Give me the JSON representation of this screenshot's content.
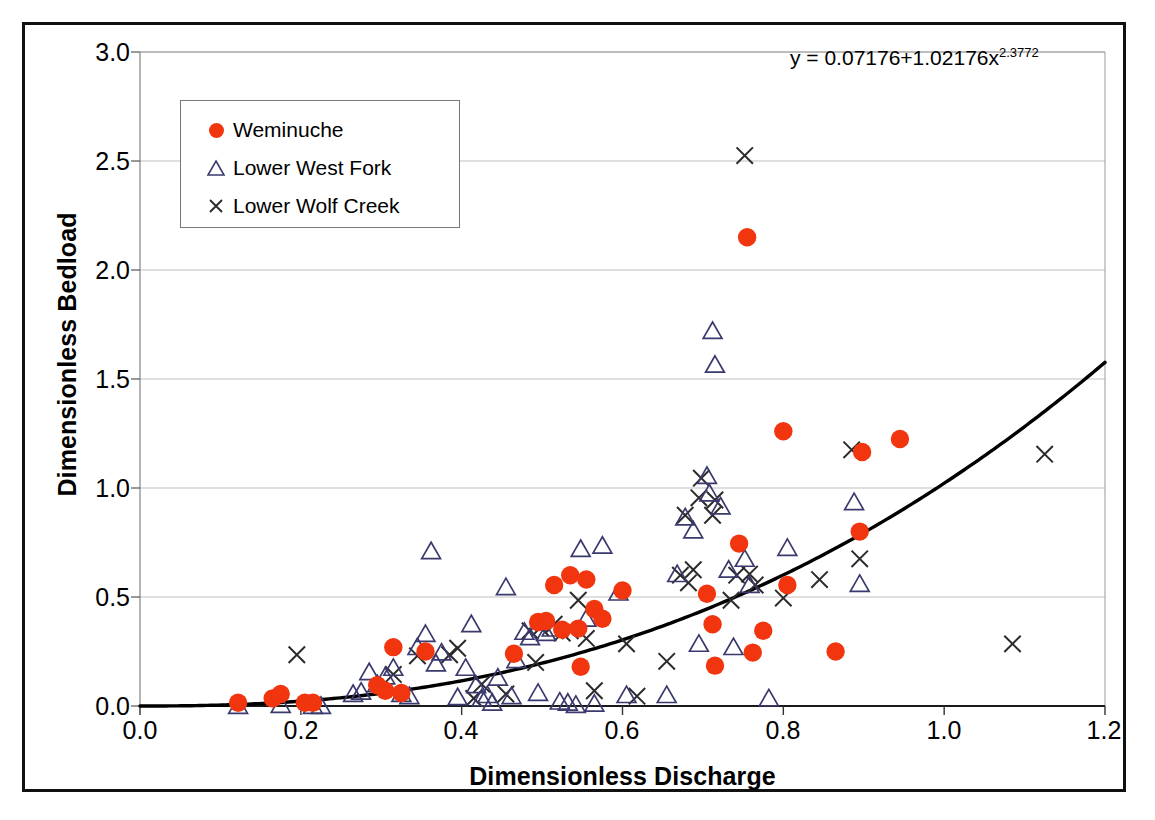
{
  "chart_data": {
    "type": "scatter",
    "title": "",
    "xlabel": "Dimensionless Discharge",
    "ylabel": "Dimensionless Bedload",
    "xlim": [
      0.0,
      1.2
    ],
    "ylim": [
      0.0,
      3.0
    ],
    "xticks": [
      "0.0",
      "0.2",
      "0.4",
      "0.6",
      "0.8",
      "1.0",
      "1.2"
    ],
    "yticks": [
      "0.0",
      "0.5",
      "1.0",
      "1.5",
      "2.0",
      "2.5",
      "3.0"
    ],
    "grid": "horizontal",
    "legend_position": "upper-left",
    "annotations": [
      {
        "text": "y = 0.07176+1.02176x",
        "exponent": "2.3772",
        "x": 0.82,
        "y": 2.82
      }
    ],
    "colors": {
      "weminuche": "#F0350F",
      "lower_west_fork": "#3A3A6E",
      "lower_wolf_creek": "#2B2B2B",
      "trendline": "#000000",
      "gridline": "#BFBFBF",
      "frame": "#111111"
    },
    "trendline": {
      "label": "power fit",
      "equation": "y = 0.07176+1.02176*x^2.3772",
      "intercept": 0.07176,
      "coefficient": 1.02176,
      "exponent": 2.3772,
      "offset": -0.0718,
      "x_range": [
        0.0,
        1.2
      ]
    },
    "series": [
      {
        "name": "Weminuche",
        "marker": "circle-filled",
        "color": "#F0350F",
        "points": [
          [
            0.122,
            0.015
          ],
          [
            0.165,
            0.035
          ],
          [
            0.175,
            0.055
          ],
          [
            0.205,
            0.015
          ],
          [
            0.215,
            0.015
          ],
          [
            0.295,
            0.095
          ],
          [
            0.305,
            0.07
          ],
          [
            0.315,
            0.27
          ],
          [
            0.325,
            0.06
          ],
          [
            0.355,
            0.25
          ],
          [
            0.465,
            0.24
          ],
          [
            0.495,
            0.385
          ],
          [
            0.505,
            0.39
          ],
          [
            0.515,
            0.555
          ],
          [
            0.525,
            0.35
          ],
          [
            0.535,
            0.6
          ],
          [
            0.545,
            0.355
          ],
          [
            0.548,
            0.18
          ],
          [
            0.555,
            0.58
          ],
          [
            0.565,
            0.445
          ],
          [
            0.575,
            0.4
          ],
          [
            0.6,
            0.53
          ],
          [
            0.705,
            0.515
          ],
          [
            0.712,
            0.375
          ],
          [
            0.715,
            0.185
          ],
          [
            0.745,
            0.745
          ],
          [
            0.755,
            2.15
          ],
          [
            0.762,
            0.245
          ],
          [
            0.775,
            0.345
          ],
          [
            0.8,
            1.26
          ],
          [
            0.805,
            0.555
          ],
          [
            0.865,
            0.25
          ],
          [
            0.895,
            0.8
          ],
          [
            0.898,
            1.165
          ],
          [
            0.945,
            1.225
          ]
        ]
      },
      {
        "name": "Lower West Fork",
        "marker": "triangle-open",
        "color": "#3A3A6E",
        "points": [
          [
            0.122,
            0.0
          ],
          [
            0.175,
            0.005
          ],
          [
            0.215,
            0.0
          ],
          [
            0.225,
            0.0
          ],
          [
            0.265,
            0.055
          ],
          [
            0.275,
            0.065
          ],
          [
            0.285,
            0.155
          ],
          [
            0.295,
            0.1
          ],
          [
            0.305,
            0.135
          ],
          [
            0.315,
            0.175
          ],
          [
            0.325,
            0.055
          ],
          [
            0.335,
            0.045
          ],
          [
            0.345,
            0.27
          ],
          [
            0.355,
            0.33
          ],
          [
            0.362,
            0.71
          ],
          [
            0.368,
            0.195
          ],
          [
            0.375,
            0.245
          ],
          [
            0.395,
            0.04
          ],
          [
            0.405,
            0.175
          ],
          [
            0.412,
            0.375
          ],
          [
            0.418,
            0.095
          ],
          [
            0.425,
            0.035
          ],
          [
            0.432,
            0.05
          ],
          [
            0.438,
            0.015
          ],
          [
            0.445,
            0.13
          ],
          [
            0.455,
            0.545
          ],
          [
            0.462,
            0.045
          ],
          [
            0.468,
            0.21
          ],
          [
            0.478,
            0.34
          ],
          [
            0.485,
            0.315
          ],
          [
            0.495,
            0.06
          ],
          [
            0.505,
            0.335
          ],
          [
            0.512,
            0.355
          ],
          [
            0.522,
            0.02
          ],
          [
            0.532,
            0.015
          ],
          [
            0.542,
            0.005
          ],
          [
            0.548,
            0.72
          ],
          [
            0.555,
            0.4
          ],
          [
            0.565,
            0.01
          ],
          [
            0.575,
            0.735
          ],
          [
            0.595,
            0.52
          ],
          [
            0.605,
            0.05
          ],
          [
            0.655,
            0.05
          ],
          [
            0.668,
            0.605
          ],
          [
            0.678,
            0.865
          ],
          [
            0.688,
            0.805
          ],
          [
            0.695,
            0.285
          ],
          [
            0.705,
            1.055
          ],
          [
            0.708,
            0.975
          ],
          [
            0.712,
            1.72
          ],
          [
            0.715,
            1.565
          ],
          [
            0.722,
            0.915
          ],
          [
            0.732,
            0.625
          ],
          [
            0.738,
            0.27
          ],
          [
            0.752,
            0.675
          ],
          [
            0.758,
            0.555
          ],
          [
            0.782,
            0.035
          ],
          [
            0.805,
            0.725
          ],
          [
            0.888,
            0.935
          ],
          [
            0.895,
            0.56
          ]
        ]
      },
      {
        "name": "Lower Wolf Creek",
        "marker": "x",
        "color": "#2B2B2B",
        "points": [
          [
            0.195,
            0.235
          ],
          [
            0.315,
            0.145
          ],
          [
            0.345,
            0.23
          ],
          [
            0.385,
            0.235
          ],
          [
            0.395,
            0.265
          ],
          [
            0.415,
            0.035
          ],
          [
            0.425,
            0.1
          ],
          [
            0.455,
            0.055
          ],
          [
            0.485,
            0.345
          ],
          [
            0.492,
            0.2
          ],
          [
            0.498,
            0.36
          ],
          [
            0.515,
            0.375
          ],
          [
            0.525,
            0.335
          ],
          [
            0.535,
            0.345
          ],
          [
            0.545,
            0.485
          ],
          [
            0.555,
            0.31
          ],
          [
            0.565,
            0.07
          ],
          [
            0.605,
            0.285
          ],
          [
            0.618,
            0.045
          ],
          [
            0.655,
            0.205
          ],
          [
            0.672,
            0.6
          ],
          [
            0.678,
            0.875
          ],
          [
            0.682,
            0.565
          ],
          [
            0.688,
            0.625
          ],
          [
            0.695,
            0.955
          ],
          [
            0.698,
            1.045
          ],
          [
            0.712,
            0.875
          ],
          [
            0.715,
            0.945
          ],
          [
            0.735,
            0.485
          ],
          [
            0.742,
            0.6
          ],
          [
            0.752,
            2.525
          ],
          [
            0.758,
            0.605
          ],
          [
            0.765,
            0.555
          ],
          [
            0.8,
            0.495
          ],
          [
            0.845,
            0.58
          ],
          [
            0.885,
            1.175
          ],
          [
            0.895,
            0.675
          ],
          [
            1.085,
            0.285
          ],
          [
            1.125,
            1.155
          ]
        ]
      }
    ]
  },
  "legend": {
    "items": [
      {
        "label": "Weminuche",
        "marker": "circle-filled",
        "color": "#F0350F"
      },
      {
        "label": "Lower West Fork",
        "marker": "triangle-open",
        "color": "#3A3A6E"
      },
      {
        "label": "Lower Wolf Creek",
        "marker": "x",
        "color": "#2B2B2B"
      }
    ]
  },
  "axes": {
    "x_title": "Dimensionless Discharge",
    "y_title": "Dimensionless Bedload",
    "x_ticks": [
      "0.0",
      "0.2",
      "0.4",
      "0.6",
      "0.8",
      "1.0",
      "1.2"
    ],
    "y_ticks": [
      "3.0",
      "2.5",
      "2.0",
      "1.5",
      "1.0",
      "0.5",
      "0.0"
    ]
  },
  "equation": {
    "base": "y = 0.07176+1.02176x",
    "exponent": "2.3772"
  }
}
